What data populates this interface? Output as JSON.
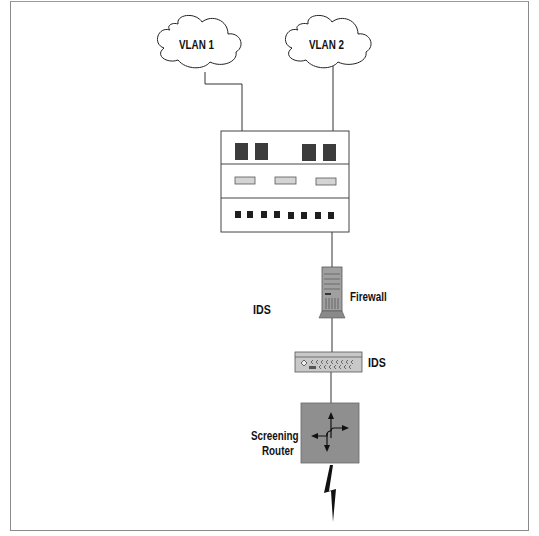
{
  "diagram": {
    "type": "network-topology",
    "nodes": {
      "vlan1": {
        "label": "VLAN 1",
        "shape": "cloud"
      },
      "vlan2": {
        "label": "VLAN 2",
        "shape": "cloud"
      },
      "switch": {
        "label": "",
        "shape": "switch-chassis"
      },
      "firewall": {
        "label": "Firewall",
        "shape": "server-tower"
      },
      "ids_left": {
        "label": "IDS",
        "shape": "text"
      },
      "ids": {
        "label": "IDS",
        "shape": "rack-device"
      },
      "router": {
        "label_line1": "Screening",
        "label_line2": "Router",
        "shape": "router-box"
      },
      "internet": {
        "label": "",
        "shape": "lightning-bolt"
      }
    },
    "edges": [
      {
        "from": "vlan1",
        "to": "switch"
      },
      {
        "from": "vlan2",
        "to": "switch"
      },
      {
        "from": "switch",
        "to": "firewall"
      },
      {
        "from": "firewall",
        "to": "ids"
      },
      {
        "from": "ids",
        "to": "router"
      },
      {
        "from": "router",
        "to": "internet"
      }
    ],
    "colors": {
      "port_dark": "#3c3c3c",
      "port_light": "#d4d4d4",
      "server": "#a0a0a0",
      "router": "#8f8f8f",
      "line": "#333333"
    }
  }
}
